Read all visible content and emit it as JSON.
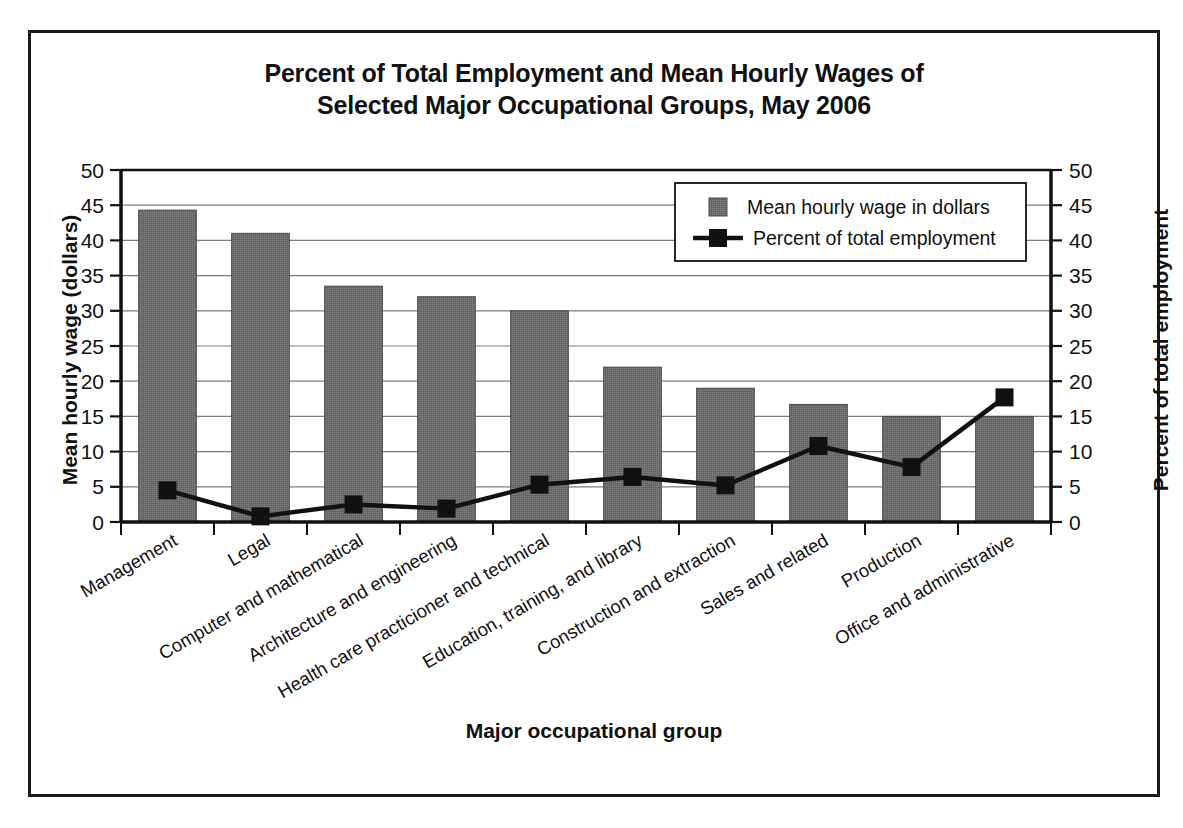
{
  "chart_data": {
    "type": "bar",
    "title": "Percent of Total Employment and Mean Hourly Wages of Selected Major Occupational Groups, May 2006",
    "title_line1": "Percent of Total Employment and Mean Hourly Wages of",
    "title_line2": "Selected Major Occupational Groups, May 2006",
    "xlabel": "Major occupational group",
    "ylabel": "Mean hourly wage (dollars)",
    "ylabel_right": "Percent of total employment",
    "categories": [
      "Management",
      "Legal",
      "Computer and mathematical",
      "Architecture and engineering",
      "Health care practicioner and technical",
      "Education, training, and library",
      "Construction and extraction",
      "Sales and related",
      "Production",
      "Office and administrative"
    ],
    "series": [
      {
        "name": "Mean hourly wage in dollars",
        "type": "bar",
        "axis": "left",
        "color": "#6e6e6e",
        "values": [
          44.3,
          41.0,
          33.5,
          32.0,
          30.0,
          22.0,
          19.0,
          16.7,
          15.0,
          15.0
        ]
      },
      {
        "name": "Percent of total employment",
        "type": "line",
        "axis": "right",
        "color": "#111111",
        "values": [
          4.5,
          0.8,
          2.5,
          1.9,
          5.3,
          6.4,
          5.2,
          10.8,
          7.8,
          17.7
        ]
      }
    ],
    "ylim": [
      0,
      50
    ],
    "ylim_right": [
      0,
      50
    ],
    "yticks": [
      0,
      5,
      10,
      15,
      20,
      25,
      30,
      35,
      40,
      45,
      50
    ],
    "yticks_right": [
      0,
      5,
      10,
      15,
      20,
      25,
      30,
      35,
      40,
      45,
      50
    ],
    "grid": true,
    "legend_position": "upper right",
    "legend": [
      {
        "label": "Mean hourly wage in dollars",
        "marker": "square",
        "color": "#6e6e6e"
      },
      {
        "label": "Percent of total employment",
        "marker": "line-square",
        "color": "#111111"
      }
    ]
  }
}
